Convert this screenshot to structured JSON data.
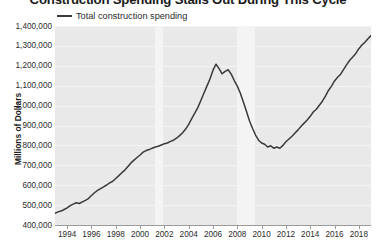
{
  "chart_data": {
    "type": "line",
    "title": "Construction Spending Stalls Out During This Cycle",
    "xlabel": "",
    "ylabel": "Millions of Dollars",
    "ylim": [
      400000,
      1400000
    ],
    "xlim": [
      1993,
      2019
    ],
    "grid": true,
    "legend_position": "top-left",
    "y_ticks": [
      "1,400,000",
      "1,300,000",
      "1,200,000",
      "1,100,000",
      "1,000,000",
      "900,000",
      "800,000",
      "700,000",
      "600,000",
      "500,000",
      "400,000"
    ],
    "y_tick_values": [
      1400000,
      1300000,
      1200000,
      1100000,
      1000000,
      900000,
      800000,
      700000,
      600000,
      500000,
      400000
    ],
    "x_ticks": [
      "1994",
      "1996",
      "1998",
      "2000",
      "2002",
      "2004",
      "2006",
      "2008",
      "2010",
      "2012",
      "2014",
      "2016",
      "2018"
    ],
    "x_tick_values": [
      1994,
      1996,
      1998,
      2000,
      2002,
      2004,
      2006,
      2008,
      2010,
      2012,
      2014,
      2016,
      2018
    ],
    "series": [
      {
        "name": "Total construction spending",
        "color": "#3a3a3a",
        "x": [
          1993.0,
          1993.25,
          1993.5,
          1993.75,
          1994.0,
          1994.25,
          1994.5,
          1994.75,
          1995.0,
          1995.25,
          1995.5,
          1995.75,
          1996.0,
          1996.25,
          1996.5,
          1996.75,
          1997.0,
          1997.25,
          1997.5,
          1997.75,
          1998.0,
          1998.25,
          1998.5,
          1998.75,
          1999.0,
          1999.25,
          1999.5,
          1999.75,
          2000.0,
          2000.25,
          2000.5,
          2000.75,
          2001.0,
          2001.25,
          2001.5,
          2001.75,
          2002.0,
          2002.25,
          2002.5,
          2002.75,
          2003.0,
          2003.25,
          2003.5,
          2003.75,
          2004.0,
          2004.25,
          2004.5,
          2004.75,
          2005.0,
          2005.25,
          2005.5,
          2005.75,
          2006.0,
          2006.25,
          2006.5,
          2006.75,
          2007.0,
          2007.25,
          2007.5,
          2007.75,
          2008.0,
          2008.25,
          2008.5,
          2008.75,
          2009.0,
          2009.25,
          2009.5,
          2009.75,
          2010.0,
          2010.25,
          2010.5,
          2010.75,
          2011.0,
          2011.25,
          2011.5,
          2011.75,
          2012.0,
          2012.25,
          2012.5,
          2012.75,
          2013.0,
          2013.25,
          2013.5,
          2013.75,
          2014.0,
          2014.25,
          2014.5,
          2014.75,
          2015.0,
          2015.25,
          2015.5,
          2015.75,
          2016.0,
          2016.25,
          2016.5,
          2016.75,
          2017.0,
          2017.25,
          2017.5,
          2017.75,
          2018.0,
          2018.25,
          2018.5,
          2018.75,
          2019.0
        ],
        "values": [
          458000,
          466000,
          470000,
          478000,
          486000,
          497000,
          505000,
          512000,
          508000,
          516000,
          524000,
          533000,
          548000,
          562000,
          574000,
          583000,
          592000,
          601000,
          612000,
          620000,
          634000,
          648000,
          663000,
          676000,
          694000,
          712000,
          726000,
          739000,
          752000,
          766000,
          774000,
          779000,
          786000,
          792000,
          796000,
          802000,
          808000,
          812000,
          820000,
          826000,
          836000,
          849000,
          864000,
          882000,
          906000,
          934000,
          962000,
          990000,
          1026000,
          1062000,
          1098000,
          1134000,
          1178000,
          1208000,
          1186000,
          1160000,
          1172000,
          1180000,
          1158000,
          1126000,
          1098000,
          1062000,
          1018000,
          972000,
          924000,
          886000,
          852000,
          826000,
          812000,
          806000,
          792000,
          798000,
          786000,
          792000,
          786000,
          800000,
          818000,
          832000,
          846000,
          862000,
          878000,
          896000,
          912000,
          928000,
          946000,
          968000,
          982000,
          1002000,
          1022000,
          1048000,
          1076000,
          1098000,
          1124000,
          1142000,
          1158000,
          1182000,
          1206000,
          1228000,
          1244000,
          1262000,
          1286000,
          1304000,
          1318000,
          1336000,
          1352000
        ]
      }
    ],
    "recession_bands": [
      {
        "start": 2001.2,
        "end": 2001.85,
        "label": "2001 recession"
      },
      {
        "start": 2007.95,
        "end": 2009.45,
        "label": "2008-2009 recession"
      }
    ]
  },
  "legend": {
    "entries": [
      {
        "label": "Total construction spending",
        "color": "#3a3a3a"
      }
    ]
  }
}
